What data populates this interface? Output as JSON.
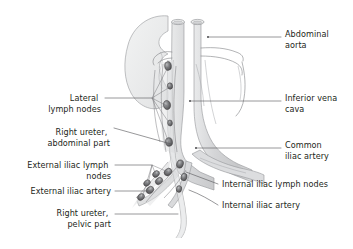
{
  "figure": {
    "background_color": "#ffffff",
    "text_color": "#231f20",
    "leader_color": "#58585b",
    "outline_color": "#808285"
  },
  "palette": {
    "vessel_fill": "#d9dadb",
    "vessel_fill_light": "#e8e9ea",
    "kidney_fill": "#eceded",
    "lymph_fill": "#e3e4e5",
    "node_fill": "#6d6e71",
    "node_fill_dark": "#414042",
    "node_highlight": "#a7a9ac",
    "ureter_fill": "#e0e1e2"
  },
  "labels": {
    "left": [
      {
        "id": "lateral-lymph-nodes",
        "lines": [
          "Lateral",
          "lymph nodes"
        ],
        "x": 101,
        "y": 101
      },
      {
        "id": "right-ureter-abdominal-part",
        "lines": [
          "Right ureter,",
          "abdominal part"
        ],
        "x": 110,
        "y": 135
      },
      {
        "id": "external-iliac-lymph-nodes",
        "lines": [
          "External iliac lymph",
          "nodes"
        ],
        "x": 111,
        "y": 168
      },
      {
        "id": "external-iliac-artery",
        "lines": [
          "External iliac artery"
        ],
        "x": 111,
        "y": 194
      },
      {
        "id": "right-ureter-pelvic-part",
        "lines": [
          "Right ureter,",
          "pelvic part"
        ],
        "x": 111,
        "y": 216
      }
    ],
    "right": [
      {
        "id": "abdominal-aorta",
        "lines": [
          "Abdominal",
          "aorta"
        ],
        "x": 285,
        "y": 37
      },
      {
        "id": "inferior-vena-cava",
        "lines": [
          "Inferior vena",
          "cava"
        ],
        "x": 285,
        "y": 101
      },
      {
        "id": "common-iliac-artery",
        "lines": [
          "Common",
          "iliac artery"
        ],
        "x": 285,
        "y": 148
      },
      {
        "id": "internal-iliac-lymph-nodes",
        "lines": [
          "Internal iliac lymph nodes"
        ],
        "x": 222,
        "y": 184
      },
      {
        "id": "internal-iliac-artery",
        "lines": [
          "Internal iliac artery"
        ],
        "x": 222,
        "y": 208
      }
    ]
  },
  "structures": [
    {
      "id": "kidney",
      "name": "right kidney"
    },
    {
      "id": "abdominal-aorta",
      "name": "abdominal aorta"
    },
    {
      "id": "inferior-vena-cava",
      "name": "inferior vena cava"
    },
    {
      "id": "common-iliac-artery",
      "name": "common iliac artery"
    },
    {
      "id": "internal-iliac-artery",
      "name": "internal iliac artery"
    },
    {
      "id": "external-iliac-artery",
      "name": "external iliac artery"
    },
    {
      "id": "ureter",
      "name": "right ureter"
    },
    {
      "id": "lateral-lymph-nodes",
      "name": "lateral (lumbar) lymph nodes"
    },
    {
      "id": "external-iliac-lymph-nodes",
      "name": "external iliac lymph nodes"
    },
    {
      "id": "internal-iliac-lymph-nodes",
      "name": "internal iliac lymph nodes"
    }
  ]
}
